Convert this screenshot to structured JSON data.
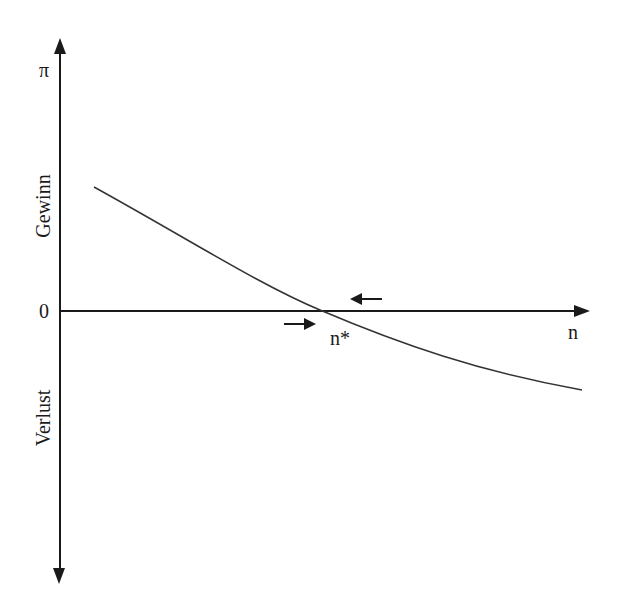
{
  "diagram": {
    "y_axis": {
      "symbol": "π",
      "upper_label": "Gewinn",
      "lower_label": "Verlust",
      "zero_label": "0"
    },
    "x_axis": {
      "label": "n"
    },
    "equilibrium_label": "n*",
    "arrows": [
      {
        "direction": "right",
        "position": "left-of-equilibrium-below-axis"
      },
      {
        "direction": "left",
        "position": "right-of-equilibrium-above-axis"
      }
    ],
    "curve": {
      "description": "decreasing convex profit curve crossing zero at n*",
      "color": "#333333"
    },
    "colors": {
      "axis": "#1a1a1a",
      "background": "#ffffff"
    }
  }
}
